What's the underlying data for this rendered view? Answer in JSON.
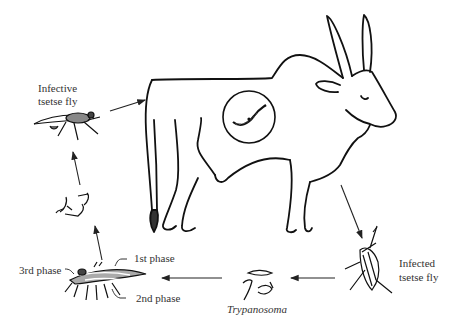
{
  "diagram": {
    "labels": {
      "infective_fly_line1": "Infective",
      "infective_fly_line2": "tsetse fly",
      "infected_fly_line1": "Infected",
      "infected_fly_line2": "tsetse fly",
      "trypanosoma": "Trypanosoma",
      "phase1": "1st phase",
      "phase2": "2nd phase",
      "phase3": "3rd phase"
    },
    "nodes": [
      {
        "id": "cattle",
        "description": "Zebu ox host with trypanosome inset circle"
      },
      {
        "id": "infected_fly",
        "description": "Infected tsetse fly"
      },
      {
        "id": "trypanosoma",
        "description": "Trypanosoma forms"
      },
      {
        "id": "fly_phases",
        "description": "Tsetse fly with 1st, 2nd, 3rd phase regions"
      },
      {
        "id": "metacyclic",
        "description": "Infective parasite forms"
      },
      {
        "id": "infective_fly",
        "description": "Infective tsetse fly"
      }
    ],
    "edges": [
      [
        "cattle",
        "infected_fly"
      ],
      [
        "infected_fly",
        "trypanosoma"
      ],
      [
        "trypanosoma",
        "fly_phases"
      ],
      [
        "fly_phases",
        "metacyclic"
      ],
      [
        "metacyclic",
        "infective_fly"
      ],
      [
        "infective_fly",
        "cattle"
      ]
    ]
  }
}
